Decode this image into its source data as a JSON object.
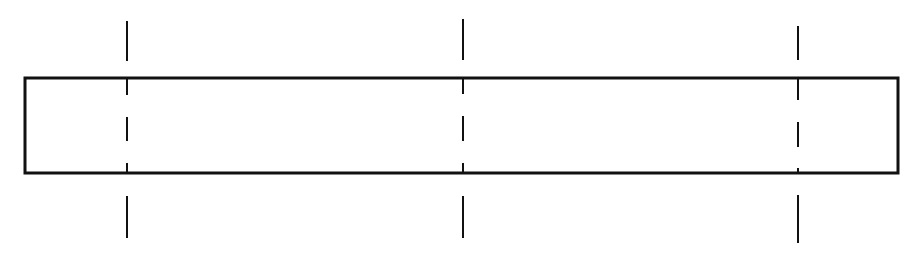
{
  "diagram": {
    "canvas": {
      "width": 916,
      "height": 264,
      "background": "#ffffff"
    },
    "stroke_color": "#111111",
    "beam": {
      "label": "",
      "x1": 25,
      "y1": 78,
      "x2": 898,
      "y2": 173,
      "stroke_width": 3
    },
    "section_lines": [
      {
        "id": "section-line-1",
        "x": 127,
        "stroke_width": 2,
        "segments": [
          [
            21,
            61
          ],
          [
            78,
            95
          ],
          [
            117,
            141
          ],
          [
            163,
            173
          ],
          [
            196,
            238
          ]
        ]
      },
      {
        "id": "section-line-2",
        "x": 463,
        "stroke_width": 2,
        "segments": [
          [
            19,
            60
          ],
          [
            78,
            94
          ],
          [
            116,
            141
          ],
          [
            163,
            173
          ],
          [
            196,
            238
          ]
        ]
      },
      {
        "id": "section-line-3",
        "x": 798,
        "stroke_width": 2,
        "segments": [
          [
            26,
            60
          ],
          [
            78,
            100
          ],
          [
            122,
            147
          ],
          [
            168,
            173
          ],
          [
            195,
            243
          ]
        ]
      }
    ]
  }
}
